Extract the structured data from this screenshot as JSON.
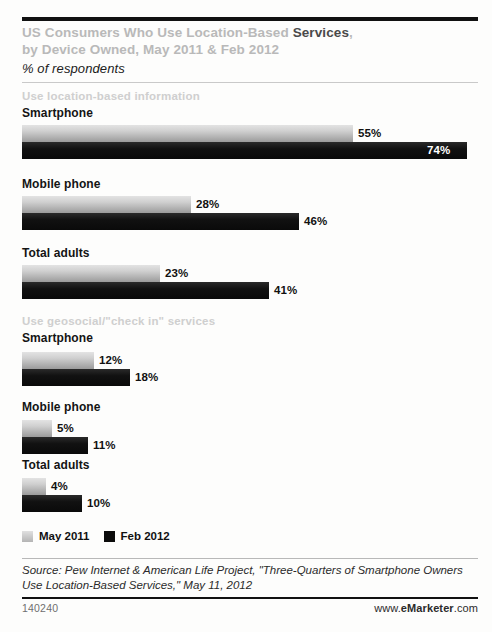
{
  "header": {
    "title_line1_plain": "US Consumers Who Use Location-Based ",
    "title_line1_strong": "Services",
    "title_line1_tail": ",",
    "title_line2": "by Device Owned, May 2011 & Feb 2012",
    "subtitle": "% of respondents"
  },
  "legend": {
    "items": [
      {
        "label": "May 2011",
        "color": "#c8c8c8",
        "key": "may"
      },
      {
        "label": "Feb 2012",
        "color": "#0b0b0b",
        "key": "feb"
      }
    ]
  },
  "footer": {
    "source": "Source: Pew Internet & American Life Project, \"Three-Quarters of Smartphone Owners Use Location-Based Services,\" May 11, 2012",
    "id": "140240",
    "url_prefix": "www.",
    "url_brand_e": "e",
    "url_brand_name": "Marketer",
    "url_suffix": ".com"
  },
  "chart_data": {
    "type": "bar",
    "orientation": "horizontal",
    "title": "US Consumers Who Use Location-Based Services, by Device Owned, May 2011 & Feb 2012",
    "subtitle": "% of respondents",
    "xlabel": "",
    "ylabel": "",
    "unit": "%",
    "xlim": [
      0,
      80
    ],
    "grid": false,
    "legend_position": "bottom-left",
    "series_names": [
      "May 2011",
      "Feb 2012"
    ],
    "groups": [
      {
        "section": "Use location-based information",
        "categories": [
          "Smartphone",
          "Mobile phone",
          "Total adults"
        ],
        "series": [
          {
            "name": "May 2011",
            "values": [
              55,
              28,
              23
            ]
          },
          {
            "name": "Feb 2012",
            "values": [
              74,
              46,
              41
            ]
          }
        ]
      },
      {
        "section": "Use geosocial/\"check in\" services",
        "categories": [
          "Smartphone",
          "Mobile phone",
          "Total adults"
        ],
        "series": [
          {
            "name": "May 2011",
            "values": [
              12,
              5,
              4
            ]
          },
          {
            "name": "Feb 2012",
            "values": [
              18,
              11,
              10
            ]
          }
        ]
      }
    ],
    "labels": {
      "g0_smartphone_may": "55%",
      "g0_smartphone_feb": "74%",
      "g0_mobile_may": "28%",
      "g0_mobile_feb": "46%",
      "g0_total_may": "23%",
      "g0_total_feb": "41%",
      "g1_smartphone_may": "12%",
      "g1_smartphone_feb": "18%",
      "g1_mobile_may": "5%",
      "g1_mobile_feb": "11%",
      "g1_total_may": "4%",
      "g1_total_feb": "10%"
    }
  }
}
